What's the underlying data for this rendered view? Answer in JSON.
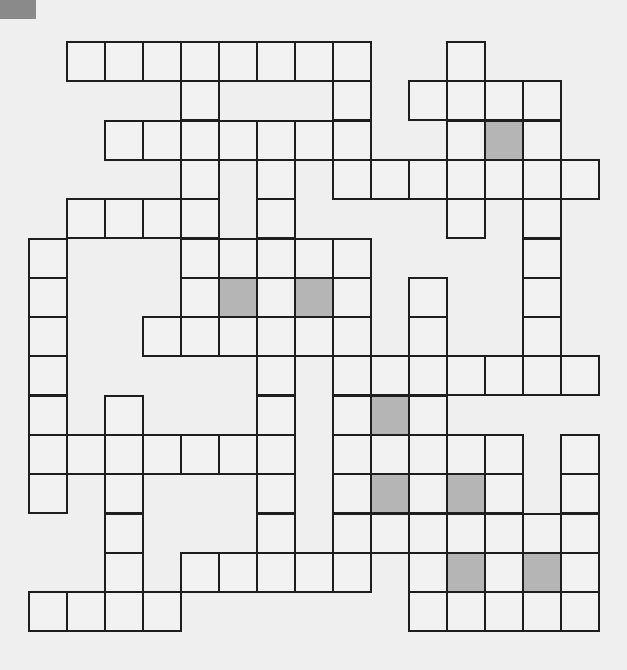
{
  "puzzle": {
    "type": "crossword",
    "rows": 15,
    "cols": 15,
    "cell_width": 38,
    "cell_height": 39.3,
    "legend": {
      "#": "white cell",
      "S": "shaded cell",
      ".": "no cell"
    },
    "grid": [
      ".########..#...",
      "....#...#.####.",
      "..#######..#S#.",
      "....#.#.#######",
      ".####.#....#.#.",
      "#...#####....#.",
      "#...#S#S#.#..#.",
      "#..######.#..#.",
      "#.....#.#######",
      "#.#...#.#S#....",
      "#######.#####.#",
      "#.#...#.#S#S#.#",
      "..#...#.#######",
      "..#.#####.#S#S#",
      "####......#####"
    ]
  },
  "colors": {
    "background": "#efefef",
    "cell": "#f2f2f2",
    "shaded": "#b5b5b5",
    "border": "#1e1e1e",
    "corner_block": "#8a8a8a"
  }
}
